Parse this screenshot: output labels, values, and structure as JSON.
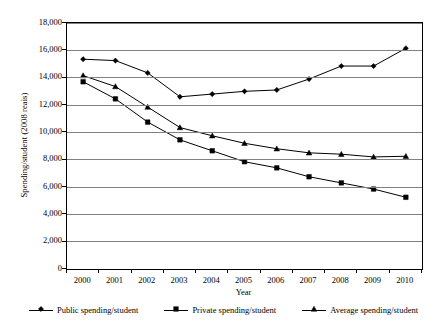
{
  "chart_data": {
    "type": "line",
    "title": "",
    "subtitle": "",
    "xlabel": "Year",
    "ylabel": "Spending/student (2008 reais)",
    "categories": [
      "2000",
      "2001",
      "2002",
      "2003",
      "2004",
      "2005",
      "2006",
      "2007",
      "2008",
      "2009",
      "2010"
    ],
    "x": [
      2000,
      2001,
      2002,
      2003,
      2004,
      2005,
      2006,
      2007,
      2008,
      2009,
      2010
    ],
    "ylim": [
      0,
      18000
    ],
    "ytick_values": [
      0,
      2000,
      4000,
      6000,
      8000,
      10000,
      12000,
      14000,
      16000,
      18000
    ],
    "ytick_labels": [
      "0",
      "2,000",
      "4,000",
      "6,000",
      "8,000",
      "10,000",
      "12,000",
      "14,000",
      "16,000",
      "18,000"
    ],
    "grid": true,
    "grid_axis": "y",
    "legend_position": "bottom",
    "series": [
      {
        "name": "Public spending/student",
        "marker": "diamond",
        "color": "#000000",
        "values": [
          15350,
          15250,
          14350,
          12600,
          12800,
          13000,
          13100,
          13900,
          14850,
          14850,
          16150
        ]
      },
      {
        "name": "Private spending/student",
        "marker": "square",
        "color": "#000000",
        "values": [
          13700,
          12450,
          10750,
          9450,
          8650,
          7850,
          7400,
          6750,
          6300,
          5850,
          5250
        ]
      },
      {
        "name": "Average spending/student",
        "marker": "triangle",
        "color": "#000000",
        "values": [
          14150,
          13350,
          11850,
          10350,
          9750,
          9200,
          8800,
          8500,
          8400,
          8200,
          8250
        ]
      }
    ]
  },
  "axes": {
    "y_title": "Spending/student (2008 reais)",
    "x_title": "Year"
  },
  "legend": {
    "items": [
      {
        "label": "Public spending/student",
        "marker": "diamond-marker-icon"
      },
      {
        "label": "Private spending/student",
        "marker": "square-marker-icon"
      },
      {
        "label": "Average spending/student",
        "marker": "triangle-marker-icon"
      }
    ]
  },
  "style": {
    "axis_color": "#000000",
    "grid_color": "#808080",
    "series_color": "#000000",
    "background": "#ffffff"
  }
}
